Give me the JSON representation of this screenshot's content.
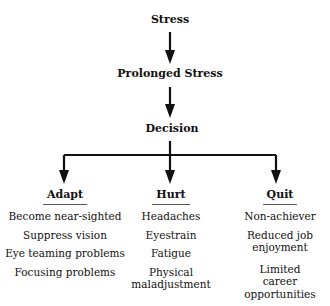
{
  "nodes": {
    "stress": "Stress",
    "prolonged": "Prolonged Stress",
    "decision": "Decision"
  },
  "branches": [
    {
      "label": "Adapt",
      "items": [
        "Become near-sighted",
        "Suppress vision",
        "Eye teaming problems",
        "Focusing problems"
      ]
    },
    {
      "label": "Hurt",
      "items": [
        "Headaches",
        "Eyestrain",
        "Fatigue",
        "Physical maladjustment"
      ]
    },
    {
      "label": "Quit",
      "items": [
        "Non-achiever",
        "Reduced job enjoyment",
        "Limited career opportunities"
      ]
    }
  ]
}
